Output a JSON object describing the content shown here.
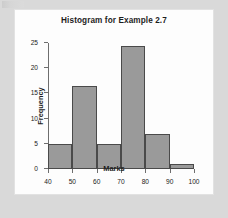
{
  "chart_data": {
    "type": "bar",
    "title": "Histogram for Example 2.7",
    "xlabel": "Marks",
    "ylabel": "Frequency",
    "categories": [
      "40-50",
      "50-60",
      "60-70",
      "70-80",
      "80-90",
      "90-100"
    ],
    "bin_edges": [
      40,
      50,
      60,
      70,
      80,
      90,
      100
    ],
    "values": [
      5,
      16.5,
      5,
      24.5,
      7,
      1
    ],
    "xlim": [
      40,
      100
    ],
    "ylim": [
      0,
      25
    ],
    "x_ticks": [
      40,
      50,
      60,
      70,
      80,
      90,
      100
    ],
    "y_ticks": [
      0,
      5,
      10,
      15,
      20,
      25
    ],
    "x_tick_labels": [
      "40",
      "50",
      "60",
      "70",
      "80",
      "90",
      "100"
    ],
    "y_tick_labels": [
      "0",
      "5",
      "10",
      "15",
      "20",
      "25"
    ],
    "grid": false,
    "legend": false,
    "bar_fill_color": "#9a9a9a",
    "bar_edge_color": "#4a4a4a",
    "axis_color": "#6e6e6e",
    "panel_color": "#fdfdfd",
    "page_background_color": "#d9d9d9"
  }
}
